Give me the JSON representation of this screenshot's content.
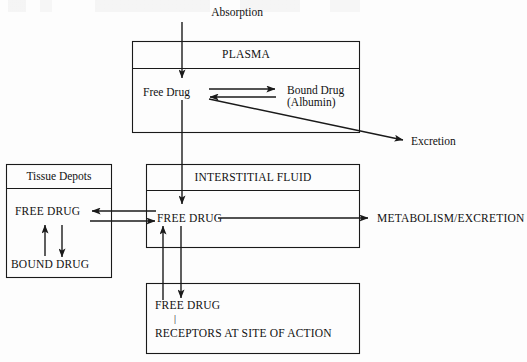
{
  "diagram": {
    "colors": {
      "stroke": "#1a1a1a",
      "background": "#fdfdfd",
      "text": "#111111"
    },
    "external_labels": {
      "absorption": "Absorption",
      "excretion": "Excretion",
      "metabolism_excretion": "METABOLISM/EXCRETION"
    },
    "boxes": {
      "plasma": {
        "header": "PLASMA",
        "free_drug": "Free Drug",
        "bound_drug_line1": "Bound Drug",
        "bound_drug_line2": "(Albumin)"
      },
      "tissue_depots": {
        "header": "Tissue Depots",
        "free_drug": "FREE DRUG",
        "bound_drug": "BOUND DRUG"
      },
      "interstitial_fluid": {
        "header": "INTERSTITIAL FLUID",
        "free_drug": "FREE DRUG"
      },
      "receptors": {
        "free_drug": "FREE DRUG",
        "bond": "|",
        "receptors": "RECEPTORS AT SITE OF ACTION"
      }
    },
    "arrows": [
      {
        "name": "absorption-to-plasma",
        "from": "Absorption",
        "to": "PLASMA Free Drug",
        "style": "single"
      },
      {
        "name": "free-to-bound-plasma",
        "from": "Free Drug",
        "to": "Bound Drug (Albumin)",
        "style": "single"
      },
      {
        "name": "bound-to-free-plasma",
        "from": "Bound Drug (Albumin)",
        "to": "Free Drug",
        "style": "single"
      },
      {
        "name": "plasma-to-excretion",
        "from": "PLASMA",
        "to": "Excretion",
        "style": "single"
      },
      {
        "name": "plasma-free-drug-to-interstitial",
        "from": "PLASMA Free Drug",
        "to": "INTERSTITIAL FLUID FREE DRUG",
        "style": "single"
      },
      {
        "name": "interstitial-to-tissue-depots",
        "from": "INTERSTITIAL FLUID FREE DRUG",
        "to": "Tissue Depots FREE DRUG",
        "style": "single"
      },
      {
        "name": "tissue-depots-to-interstitial",
        "from": "Tissue Depots FREE DRUG",
        "to": "INTERSTITIAL FLUID FREE DRUG",
        "style": "single"
      },
      {
        "name": "tissue-free-to-bound",
        "from": "Tissue Depots FREE DRUG",
        "to": "Tissue Depots BOUND DRUG",
        "style": "single"
      },
      {
        "name": "tissue-bound-to-free",
        "from": "Tissue Depots BOUND DRUG",
        "to": "Tissue Depots FREE DRUG",
        "style": "single"
      },
      {
        "name": "interstitial-to-metabolism",
        "from": "INTERSTITIAL FLUID FREE DRUG",
        "to": "METABOLISM/EXCRETION",
        "style": "single"
      },
      {
        "name": "interstitial-to-receptors",
        "from": "INTERSTITIAL FLUID FREE DRUG",
        "to": "RECEPTORS FREE DRUG",
        "style": "single"
      },
      {
        "name": "receptors-to-interstitial",
        "from": "RECEPTORS FREE DRUG",
        "to": "INTERSTITIAL FLUID FREE DRUG",
        "style": "single"
      }
    ]
  }
}
